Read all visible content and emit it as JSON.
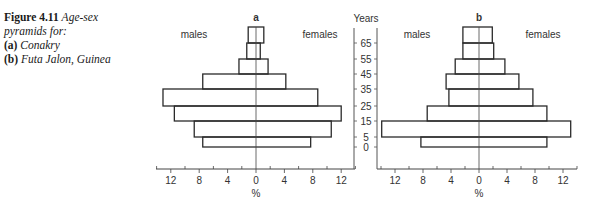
{
  "caption": {
    "figure_label": "Figure 4.11",
    "title_line1": "Age-sex",
    "title_line2": "pyramids for:",
    "item_a_label": "(a)",
    "item_a_text": "Conakry",
    "item_b_label": "(b)",
    "item_b_text": "Futa Jalon, Guinea"
  },
  "axis": {
    "years_label": "Years",
    "percent_label": "%",
    "males_label": "males",
    "females_label": "females"
  },
  "chart_data": [
    {
      "type": "bar",
      "subtype": "population-pyramid",
      "title": "a",
      "place": "Conakry",
      "xlabel": "%",
      "ylabel": "Years",
      "age_tick_labels": [
        "65",
        "55",
        "45",
        "35",
        "25",
        "15",
        "5",
        "0"
      ],
      "x_tick_labels": [
        "12",
        "8",
        "4",
        "0",
        "4",
        "8",
        "12"
      ],
      "xlim": [
        -14,
        14
      ],
      "categories": [
        "65+",
        "55-65",
        "45-55",
        "35-45",
        "25-35",
        "15-25",
        "5-15",
        "0-5"
      ],
      "series": [
        {
          "name": "males",
          "values": [
            1.1,
            1.3,
            2.4,
            7.5,
            13.1,
            11.5,
            8.7,
            7.5
          ]
        },
        {
          "name": "females",
          "values": [
            1.1,
            0.6,
            1.7,
            4.2,
            8.7,
            12.0,
            10.6,
            7.7
          ]
        }
      ],
      "grid": false
    },
    {
      "type": "bar",
      "subtype": "population-pyramid",
      "title": "b",
      "place": "Futa Jalon, Guinea",
      "xlabel": "%",
      "ylabel": "Years",
      "age_tick_labels": [
        "65",
        "55",
        "45",
        "35",
        "25",
        "15",
        "5",
        "0"
      ],
      "x_tick_labels": [
        "12",
        "8",
        "4",
        "0",
        "4",
        "8",
        "12"
      ],
      "xlim": [
        -14,
        14
      ],
      "categories": [
        "65+",
        "55-65",
        "45-55",
        "35-45",
        "25-35",
        "15-25",
        "5-15",
        "0-5"
      ],
      "series": [
        {
          "name": "males",
          "values": [
            2.3,
            2.3,
            3.4,
            4.7,
            4.3,
            7.4,
            13.9,
            8.3
          ]
        },
        {
          "name": "females",
          "values": [
            1.9,
            2.1,
            3.7,
            5.7,
            7.7,
            9.7,
            13.1,
            9.7
          ]
        }
      ],
      "grid": false
    }
  ]
}
